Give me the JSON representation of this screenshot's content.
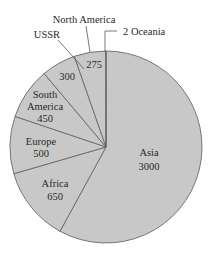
{
  "chart_data": {
    "type": "pie",
    "title": "",
    "categories": [
      "Asia",
      "Africa",
      "Europe",
      "South America",
      "USSR",
      "North America",
      "Oceania"
    ],
    "values": [
      3000,
      650,
      500,
      450,
      300,
      275,
      2
    ],
    "labels": [
      {
        "name": "Asia",
        "value": "3000"
      },
      {
        "name": "Africa",
        "value": "650"
      },
      {
        "name": "Europe",
        "value": "500"
      },
      {
        "name": "South America",
        "value": "450"
      },
      {
        "name": "USSR",
        "value": "300"
      },
      {
        "name": "North America",
        "value": "275"
      },
      {
        "name": "Oceania",
        "value": "2"
      }
    ],
    "fill_color": "#c8c8c8",
    "line_color": "#6a6a6a",
    "start_angle_deg": 0,
    "direction": "clockwise"
  },
  "text": {
    "asia_name": "Asia",
    "asia_value": "3000",
    "africa_name": "Africa",
    "africa_value": "650",
    "europe_name": "Europe",
    "europe_value": "500",
    "south_america_line1": "South",
    "south_america_line2": "America",
    "south_america_value": "450",
    "ussr_name": "USSR",
    "ussr_value": "300",
    "north_america_name": "North America",
    "north_america_value": "275",
    "oceania_label": "2 Oceania"
  }
}
